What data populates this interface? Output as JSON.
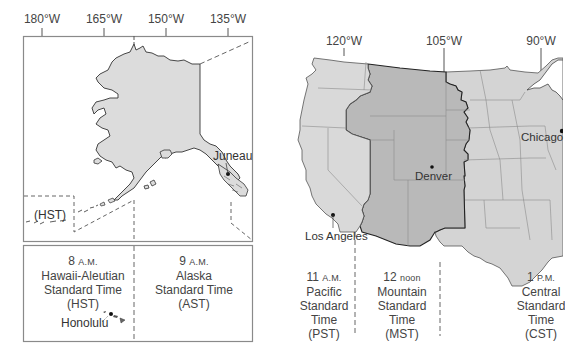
{
  "alaska_panel": {
    "longitudes": [
      {
        "label": "180°W",
        "x": 42
      },
      {
        "label": "165°W",
        "x": 104
      },
      {
        "label": "150°W",
        "x": 166
      },
      {
        "label": "135°W",
        "x": 228
      }
    ],
    "inset_label": "(HST)",
    "cities": [
      {
        "name": "Juneau"
      },
      {
        "name": "Honolulu"
      }
    ],
    "zones": [
      {
        "time_num": "8",
        "time_unit": "A.M.",
        "line1": "Hawaii-Aleutian",
        "line2": "Standard Time",
        "abbr": "(HST)"
      },
      {
        "time_num": "9",
        "time_unit": "A.M.",
        "line1": "Alaska",
        "line2": "Standard Time",
        "abbr": "(AST)"
      }
    ]
  },
  "us_panel": {
    "longitudes": [
      {
        "label": "120°W",
        "x": 344
      },
      {
        "label": "105°W",
        "x": 444
      },
      {
        "label": "90°W",
        "x": 541
      }
    ],
    "cities": [
      {
        "name": "Denver"
      },
      {
        "name": "Los Angeles"
      },
      {
        "name": "Chicago"
      }
    ],
    "zones": [
      {
        "time_num": "11",
        "time_unit": "A.M.",
        "line1": "Pacific",
        "line2": "Standard",
        "line3": "Time",
        "abbr": "(PST)"
      },
      {
        "time_num": "12",
        "time_unit": "noon",
        "line1": "Mountain",
        "line2": "Standard",
        "line3": "Time",
        "abbr": "(MST)"
      },
      {
        "time_num": "1",
        "time_unit": "P.M.",
        "line1": "Central",
        "line2": "Standard",
        "line3": "Time",
        "abbr": "(CST)"
      }
    ]
  },
  "colors": {
    "pacific_fill": "#d9d9d9",
    "mountain_fill": "#b9b9b9",
    "central_fill": "#d4d4d4",
    "alaska_fill": "#dcdcdc",
    "border": "#333333",
    "frame": "#8a8a8a"
  }
}
